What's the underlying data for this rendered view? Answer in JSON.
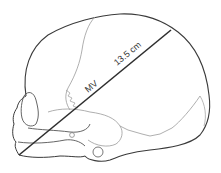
{
  "diagram": {
    "measurement": {
      "name": "MV",
      "value": "13.5 cm",
      "from": [
        19,
        155
      ],
      "to": [
        171,
        30
      ]
    },
    "colors": {
      "outline": "#3a3a3a",
      "suture": "#9a9a9a",
      "measure_line": "#2e2e2e",
      "label": "#333333"
    }
  }
}
